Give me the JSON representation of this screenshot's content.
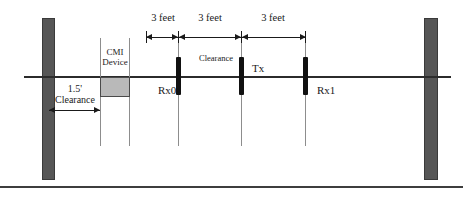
{
  "diagram": {
    "colors": {
      "wall_fill": "#565656",
      "device_fill": "#b9b9b9",
      "marker_fill": "#111111",
      "line": "#2b2b2b",
      "guide": "#8d8d8d"
    },
    "device": {
      "label_line1": "CMI",
      "label_line2": "Device"
    },
    "nodes": [
      {
        "label": "Rx0"
      },
      {
        "label": "Tx"
      },
      {
        "label": "Rx1"
      }
    ],
    "middle_label": "Clearance",
    "left_clearance": {
      "value": "1.5'",
      "label": "Clearance"
    },
    "dimensions": [
      {
        "label": "3 feet"
      },
      {
        "label": "3 feet"
      },
      {
        "label": "3 feet"
      }
    ]
  }
}
